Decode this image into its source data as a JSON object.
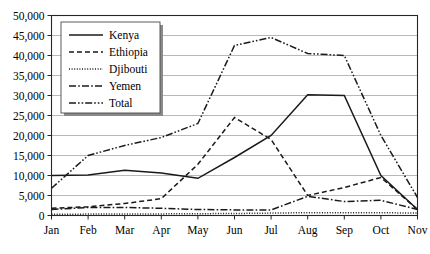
{
  "chart_data": {
    "type": "line",
    "title": "",
    "subtitle": "",
    "xlabel": "",
    "ylabel": "",
    "categories": [
      "Jan",
      "Feb",
      "Mar",
      "Apr",
      "May",
      "Jun",
      "Jul",
      "Aug",
      "Sep",
      "Oct",
      "Nov"
    ],
    "ylim": [
      0,
      50000
    ],
    "ytick_values": [
      0,
      5000,
      10000,
      15000,
      20000,
      25000,
      30000,
      35000,
      40000,
      45000,
      50000
    ],
    "ytick_labels": [
      "0",
      "5,000",
      "10,000",
      "15,000",
      "20,000",
      "25,000",
      "30,000",
      "35,000",
      "40,000",
      "45,000",
      "50,000"
    ],
    "grid": true,
    "grid_axis": "y",
    "legend_position": "top-left-inside",
    "series": [
      {
        "name": "Kenya",
        "style": "solid",
        "color": "#1a1a1a",
        "values": [
          10000,
          10100,
          11300,
          10600,
          9300,
          14500,
          20000,
          30200,
          30000,
          10000,
          1500
        ]
      },
      {
        "name": "Ethiopia",
        "style": "dashed",
        "color": "#1a1a1a",
        "values": [
          1800,
          2200,
          3000,
          4200,
          12800,
          24500,
          19000,
          5000,
          7000,
          9500,
          1500
        ]
      },
      {
        "name": "Djibouti",
        "style": "dotted",
        "color": "#1a1a1a",
        "values": [
          300,
          350,
          400,
          400,
          450,
          500,
          600,
          700,
          700,
          700,
          600
        ]
      },
      {
        "name": "Yemen",
        "style": "dash-dot",
        "color": "#1a1a1a",
        "values": [
          1500,
          2000,
          2000,
          1800,
          1500,
          1400,
          1400,
          4800,
          3500,
          3800,
          1500
        ]
      },
      {
        "name": "Total",
        "style": "dash-dot-dot",
        "color": "#1a1a1a",
        "values": [
          6800,
          15000,
          17500,
          19500,
          23000,
          42500,
          44500,
          40500,
          40000,
          20000,
          4500
        ]
      }
    ]
  },
  "legend": {
    "items": [
      {
        "label": "Kenya",
        "style": "solid"
      },
      {
        "label": "Ethiopia",
        "style": "dashed"
      },
      {
        "label": "Djibouti",
        "style": "dotted"
      },
      {
        "label": "Yemen",
        "style": "dash-dot"
      },
      {
        "label": "Total",
        "style": "dash-dot-dot"
      }
    ]
  }
}
